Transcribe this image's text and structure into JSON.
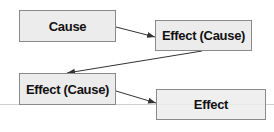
{
  "diagram": {
    "nodes": [
      {
        "id": "cause",
        "label": "Cause"
      },
      {
        "id": "effect-cause-1",
        "label": "Effect (Cause)"
      },
      {
        "id": "effect-cause-2",
        "label": "Effect (Cause)"
      },
      {
        "id": "effect",
        "label": "Effect"
      }
    ],
    "edges": [
      {
        "from": "cause",
        "to": "effect-cause-1"
      },
      {
        "from": "effect-cause-1",
        "to": "effect-cause-2"
      },
      {
        "from": "effect-cause-2",
        "to": "effect"
      }
    ],
    "colors": {
      "box_fill": "#ececec",
      "box_border": "#8a8a8a",
      "arrow": "#333333",
      "baseline": "#d0d0d0"
    }
  }
}
